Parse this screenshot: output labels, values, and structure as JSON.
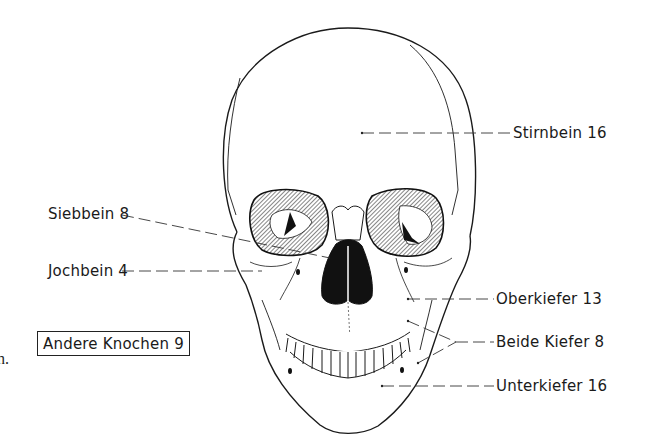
{
  "figure": {
    "labels": [
      {
        "id": "stirnbein",
        "text": "Stirnbein 16",
        "bone": "Stirnbein",
        "count": 16
      },
      {
        "id": "siebbein",
        "text": "Siebbein 8",
        "bone": "Siebbein",
        "count": 8
      },
      {
        "id": "jochbein",
        "text": "Jochbein 4",
        "bone": "Jochbein",
        "count": 4
      },
      {
        "id": "oberkiefer",
        "text": "Oberkiefer 13",
        "bone": "Oberkiefer",
        "count": 13
      },
      {
        "id": "beide-kiefer",
        "text": "Beide Kiefer 8",
        "bone": "Beide Kiefer",
        "count": 8
      },
      {
        "id": "unterkiefer",
        "text": "Unterkiefer 16",
        "bone": "Unterkiefer",
        "count": 16
      }
    ],
    "boxed_label": {
      "text": "Andere Knochen 9",
      "bone": "Andere Knochen",
      "count": 9
    },
    "margin_fragment": "n.",
    "colors": {
      "ink": "#1a1a1a",
      "background": "#ffffff"
    }
  }
}
